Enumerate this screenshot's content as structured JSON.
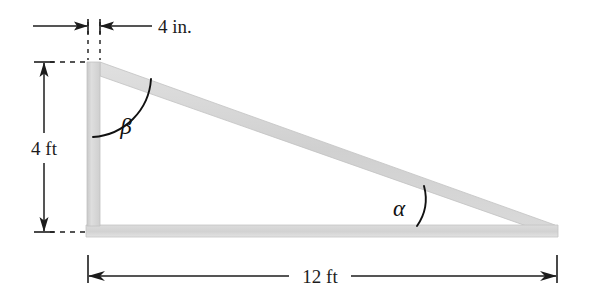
{
  "figure": {
    "background_color": "#ffffff",
    "member_fill": "#d9d9d9",
    "member_edge": "#b9b9b9",
    "line_color": "#1c1c1c",
    "dimensions": [
      {
        "id": "width-top",
        "label": "4 in.",
        "value": 4,
        "unit": "in.",
        "orientation": "horizontal",
        "describes": "thickness of vertical member"
      },
      {
        "id": "height-left",
        "label": "4 ft",
        "value": 4,
        "unit": "ft",
        "orientation": "vertical",
        "describes": "height of vertical member"
      },
      {
        "id": "span-bottom",
        "label": "12 ft",
        "value": 12,
        "unit": "ft",
        "orientation": "horizontal",
        "describes": "span of horizontal base member"
      }
    ],
    "angles": [
      {
        "id": "beta",
        "label": "β",
        "name": "beta",
        "location": "top-left joint between vertical member and diagonal member"
      },
      {
        "id": "alpha",
        "label": "α",
        "name": "alpha",
        "location": "right end between diagonal member and horizontal base member"
      }
    ],
    "members": [
      {
        "id": "vertical-member",
        "name": "vertical member"
      },
      {
        "id": "horizontal-member",
        "name": "horizontal base member"
      },
      {
        "id": "diagonal-member",
        "name": "diagonal member"
      }
    ]
  }
}
